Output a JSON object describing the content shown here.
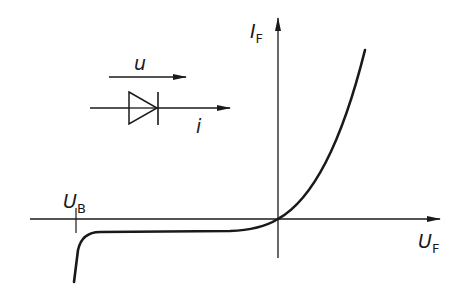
{
  "diagram": {
    "axes": {
      "y_label": {
        "main": "I",
        "sub": "F"
      },
      "x_label": {
        "main": "U",
        "sub": "F"
      }
    },
    "breakdown_label": {
      "main": "U",
      "sub": "B"
    },
    "symbol": {
      "voltage_label": "u",
      "current_label": "i"
    },
    "colors": {
      "ink": "#1a1a1a",
      "background": "#ffffff"
    }
  }
}
